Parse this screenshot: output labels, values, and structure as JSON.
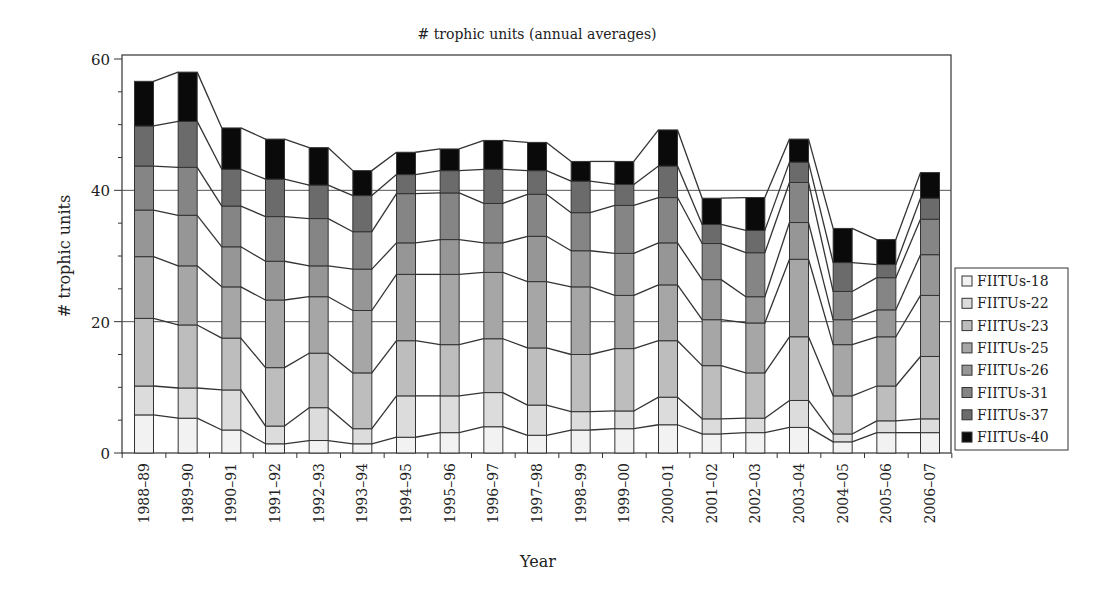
{
  "chart_data": {
    "type": "bar",
    "stacked": true,
    "title": "# trophic units (annual averages)",
    "xlabel": "Year",
    "ylabel": "# trophic units",
    "ylim": [
      0,
      60
    ],
    "yticks": [
      0,
      20,
      40,
      60
    ],
    "grid": "horizontal lines at 20 and 40",
    "legend_position": "right",
    "series_connectors": true,
    "categories": [
      "1988–89",
      "1989–90",
      "1990–91",
      "1991–92",
      "1992–93",
      "1993–94",
      "1994–95",
      "1995–96",
      "1996–97",
      "1997–98",
      "1998–99",
      "1999–00",
      "2000–01",
      "2001–02",
      "2002–03",
      "2003–04",
      "2004–05",
      "2005–06",
      "2006–07"
    ],
    "series": [
      {
        "name": "FIITUs-18",
        "color": "#f2f2f2",
        "values": [
          5.8,
          5.3,
          3.5,
          1.4,
          1.9,
          1.4,
          2.4,
          3.1,
          4.0,
          2.7,
          3.5,
          3.7,
          4.3,
          2.9,
          3.1,
          3.9,
          1.7,
          3.1,
          3.1
        ]
      },
      {
        "name": "FIITUs-22",
        "color": "#dcdcdc",
        "values": [
          4.4,
          4.6,
          6.1,
          2.7,
          5.0,
          2.3,
          6.3,
          5.6,
          5.2,
          4.6,
          2.8,
          2.7,
          4.2,
          2.3,
          2.2,
          4.1,
          1.2,
          1.8,
          2.1
        ]
      },
      {
        "name": "FIITUs-23",
        "color": "#bdbdbd",
        "values": [
          10.3,
          9.6,
          7.9,
          8.9,
          8.3,
          8.5,
          8.4,
          7.8,
          8.2,
          8.7,
          8.7,
          9.5,
          8.6,
          8.1,
          6.9,
          9.7,
          5.8,
          5.3,
          9.5
        ]
      },
      {
        "name": "FIITUs-25",
        "color": "#a6a6a6",
        "values": [
          9.4,
          9.0,
          7.8,
          10.3,
          8.6,
          9.5,
          10.1,
          10.7,
          10.1,
          10.1,
          10.3,
          8.1,
          8.5,
          7.0,
          7.6,
          11.8,
          7.8,
          7.5,
          9.3
        ]
      },
      {
        "name": "FIITUs-26",
        "color": "#969696",
        "values": [
          7.1,
          7.7,
          6.1,
          5.9,
          4.7,
          6.3,
          4.8,
          5.3,
          4.5,
          6.9,
          5.5,
          6.4,
          6.4,
          6.1,
          4.0,
          5.6,
          3.8,
          4.1,
          6.2
        ]
      },
      {
        "name": "FIITUs-31",
        "color": "#858585",
        "values": [
          6.7,
          7.3,
          6.2,
          6.8,
          7.2,
          5.7,
          7.5,
          7.1,
          6.0,
          6.4,
          5.8,
          7.3,
          6.9,
          5.5,
          6.7,
          6.1,
          4.3,
          4.9,
          5.4
        ]
      },
      {
        "name": "FIITUs-37",
        "color": "#6b6b6b",
        "values": [
          6.1,
          7.0,
          5.6,
          5.7,
          5.1,
          5.5,
          2.9,
          3.4,
          5.2,
          3.6,
          4.8,
          3.2,
          4.8,
          2.9,
          3.4,
          3.1,
          4.4,
          2.0,
          3.2
        ]
      },
      {
        "name": "FIITUs-40",
        "color": "#0a0a0a",
        "values": [
          6.8,
          7.5,
          6.3,
          6.1,
          5.7,
          3.8,
          3.4,
          3.3,
          4.4,
          4.3,
          3.0,
          3.5,
          5.5,
          4.0,
          5.0,
          3.5,
          5.2,
          3.8,
          3.9
        ]
      }
    ],
    "totals": [
      56.6,
      58.0,
      49.5,
      47.8,
      46.5,
      43.0,
      45.8,
      46.3,
      47.6,
      47.3,
      44.4,
      44.4,
      49.2,
      38.8,
      38.9,
      47.8,
      34.2,
      32.5,
      42.7
    ]
  },
  "styles": {
    "axis_color": "#333333",
    "gridline_color": "#555555",
    "bar_edge_color": "#333333"
  }
}
